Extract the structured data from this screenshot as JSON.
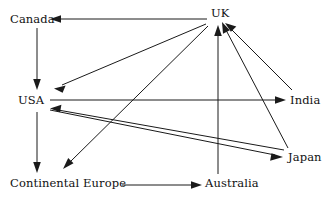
{
  "diagram": {
    "type": "directed-graph",
    "background_color": "#ffffff",
    "line_color": "#1a1a1a",
    "text_color": "#111111"
  },
  "nodes": [
    {
      "id": "canada",
      "label": "Canada",
      "x": 10,
      "y": 14
    },
    {
      "id": "uk",
      "label": "UK",
      "x": 211,
      "y": 8
    },
    {
      "id": "usa",
      "label": "USA",
      "x": 18,
      "y": 95
    },
    {
      "id": "india",
      "label": "India",
      "x": 290,
      "y": 95
    },
    {
      "id": "japan",
      "label": "Japan",
      "x": 288,
      "y": 152
    },
    {
      "id": "continental_europe",
      "label": "Continental Europe",
      "x": 10,
      "y": 178
    },
    {
      "id": "australia",
      "label": "Australia",
      "x": 205,
      "y": 178
    }
  ],
  "edges": [
    {
      "from": "uk",
      "to": "canada",
      "label": ""
    },
    {
      "from": "canada",
      "to": "usa",
      "label": ""
    },
    {
      "from": "uk",
      "to": "usa",
      "label": ""
    },
    {
      "from": "uk",
      "to": "continental_europe",
      "label": ""
    },
    {
      "from": "usa",
      "to": "continental_europe",
      "label": ""
    },
    {
      "from": "usa",
      "to": "india",
      "label": ""
    },
    {
      "from": "usa",
      "to": "japan",
      "label": ""
    },
    {
      "from": "india",
      "to": "uk",
      "label": ""
    },
    {
      "from": "japan",
      "to": "uk",
      "label": ""
    },
    {
      "from": "japan",
      "to": "usa",
      "label": ""
    },
    {
      "from": "australia",
      "to": "uk",
      "label": ""
    },
    {
      "from": "continental_europe",
      "to": "australia",
      "label": ""
    }
  ]
}
